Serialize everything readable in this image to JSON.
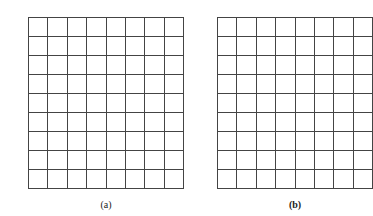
{
  "panels": [
    {
      "id": "a",
      "caption": "(a)",
      "rows": 9,
      "cols": 8,
      "x": 28,
      "y": 17,
      "cell_w": 19.4,
      "cell_h": 19
    },
    {
      "id": "b",
      "caption": "(b)",
      "rows": 9,
      "cols": 8,
      "x": 217,
      "y": 17,
      "cell_w": 19.4,
      "cell_h": 19
    }
  ],
  "colors": {
    "line": "#444444",
    "background": "#ffffff"
  }
}
